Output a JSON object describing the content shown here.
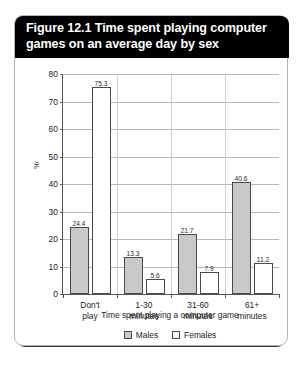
{
  "figure": {
    "title": "Figure 12.1 Time spent playing computer games on an average day by sex"
  },
  "legend": {
    "items": [
      {
        "label": "Males",
        "color": "#c9c9c9"
      },
      {
        "label": "Females",
        "color": "#ffffff"
      }
    ]
  },
  "axes": {
    "y_title": "%",
    "x_title": "Time spent playing a computer game",
    "y_ticks": [
      "0",
      "10",
      "20",
      "30",
      "40",
      "50",
      "60",
      "70",
      "80"
    ]
  },
  "chart_data": {
    "type": "bar",
    "title": "Figure 12.1 Time spent playing computer games on an average day by sex",
    "xlabel": "Time spent playing a computer game",
    "ylabel": "%",
    "ylim": [
      0,
      80
    ],
    "ytick_step": 10,
    "grid": true,
    "legend_position": "bottom",
    "categories": [
      "Don't play",
      "1-30 minutes",
      "31-60 minutes",
      "61+ minutes"
    ],
    "category_lines": [
      [
        "Don't",
        "play"
      ],
      [
        "1-30",
        "minutes"
      ],
      [
        "31-60",
        "minutes"
      ],
      [
        "61+",
        "minutes"
      ]
    ],
    "series": [
      {
        "name": "Males",
        "color": "#c9c9c9",
        "values": [
          24.4,
          13.3,
          21.7,
          40.6
        ],
        "labels": [
          "24.4",
          "13.3",
          "21.7",
          "40.6"
        ]
      },
      {
        "name": "Females",
        "color": "#ffffff",
        "values": [
          75.3,
          5.6,
          7.9,
          11.2
        ],
        "labels": [
          "75.3",
          "5.6",
          "7.9",
          "11.2"
        ]
      }
    ]
  }
}
